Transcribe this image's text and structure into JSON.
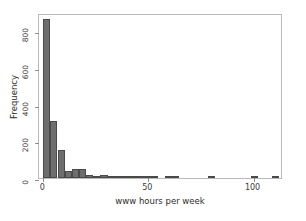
{
  "chart_data": {
    "type": "bar",
    "title": "",
    "subtitle": "",
    "xlabel": "www hours per week",
    "ylabel": "Frequency",
    "xlim": [
      -2,
      114
    ],
    "ylim": [
      0,
      900
    ],
    "xticks": [
      0,
      50,
      100
    ],
    "xticklabels": [
      "0",
      "50",
      "100"
    ],
    "yticks": [
      0,
      200,
      400,
      600,
      800
    ],
    "yticklabels": [
      "0",
      "200",
      "400",
      "600",
      "800"
    ],
    "grid": false,
    "legend": null,
    "bar_color": "#6e6e6e",
    "bar_edge_color": "#4a4a4a",
    "frame_color": "#b9b9b9",
    "background": "#ffffff",
    "bin_width": 3.4,
    "bins": [
      {
        "x0": 0.0,
        "x1": 3.4,
        "value": 870
      },
      {
        "x0": 3.4,
        "x1": 6.8,
        "value": 310
      },
      {
        "x0": 6.8,
        "x1": 10.2,
        "value": 155
      },
      {
        "x0": 10.2,
        "x1": 13.6,
        "value": 40
      },
      {
        "x0": 13.6,
        "x1": 17.0,
        "value": 47
      },
      {
        "x0": 17.0,
        "x1": 20.4,
        "value": 50
      },
      {
        "x0": 20.4,
        "x1": 23.8,
        "value": 18
      },
      {
        "x0": 23.8,
        "x1": 27.2,
        "value": 4
      },
      {
        "x0": 27.2,
        "x1": 30.6,
        "value": 14
      },
      {
        "x0": 30.6,
        "x1": 34.0,
        "value": 9
      },
      {
        "x0": 34.0,
        "x1": 37.4,
        "value": 4
      },
      {
        "x0": 37.4,
        "x1": 40.8,
        "value": 10
      },
      {
        "x0": 40.8,
        "x1": 44.2,
        "value": 8
      },
      {
        "x0": 44.2,
        "x1": 47.6,
        "value": 4
      },
      {
        "x0": 47.6,
        "x1": 51.0,
        "value": 3
      },
      {
        "x0": 51.0,
        "x1": 54.4,
        "value": 1
      },
      {
        "x0": 57.8,
        "x1": 61.2,
        "value": 2
      },
      {
        "x0": 61.2,
        "x1": 64.6,
        "value": 1
      },
      {
        "x0": 78.2,
        "x1": 81.6,
        "value": 1
      },
      {
        "x0": 98.6,
        "x1": 102.0,
        "value": 3
      },
      {
        "x0": 108.8,
        "x1": 112.2,
        "value": 2
      }
    ]
  }
}
